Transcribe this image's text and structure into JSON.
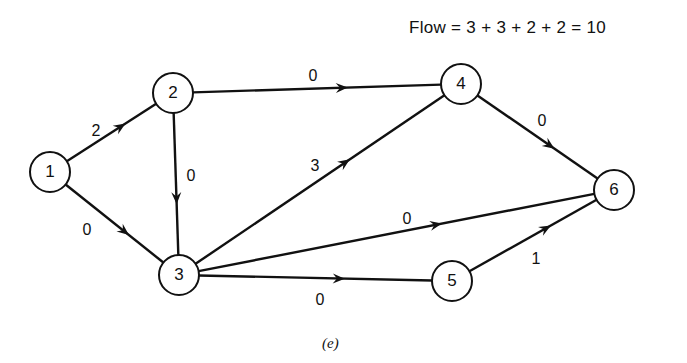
{
  "header": {
    "flow_equation": "Flow = 3 + 3 + 2 + 2 = 10"
  },
  "caption": "(e)",
  "graph": {
    "nodes": [
      {
        "id": "1",
        "label": "1",
        "x": 50,
        "y": 172
      },
      {
        "id": "2",
        "label": "2",
        "x": 173,
        "y": 93
      },
      {
        "id": "3",
        "label": "3",
        "x": 179,
        "y": 275
      },
      {
        "id": "4",
        "label": "4",
        "x": 461,
        "y": 84
      },
      {
        "id": "5",
        "label": "5",
        "x": 452,
        "y": 281
      },
      {
        "id": "6",
        "label": "6",
        "x": 614,
        "y": 190
      }
    ],
    "edges": [
      {
        "from": "1",
        "to": "2",
        "label": "2",
        "lx": 96,
        "ly": 132
      },
      {
        "from": "1",
        "to": "3",
        "label": "0",
        "lx": 87,
        "ly": 231
      },
      {
        "from": "2",
        "to": "3",
        "label": "0",
        "lx": 191,
        "ly": 177
      },
      {
        "from": "2",
        "to": "4",
        "label": "0",
        "lx": 313,
        "ly": 77
      },
      {
        "from": "3",
        "to": "4",
        "label": "3",
        "lx": 315,
        "ly": 167
      },
      {
        "from": "3",
        "to": "6",
        "label": "0",
        "lx": 407,
        "ly": 220
      },
      {
        "from": "3",
        "to": "5",
        "label": "0",
        "lx": 320,
        "ly": 301
      },
      {
        "from": "4",
        "to": "6",
        "label": "0",
        "lx": 542,
        "ly": 122
      },
      {
        "from": "5",
        "to": "6",
        "label": "1",
        "lx": 536,
        "ly": 260
      }
    ],
    "node_radius": 20,
    "stroke_color": "#111111"
  }
}
